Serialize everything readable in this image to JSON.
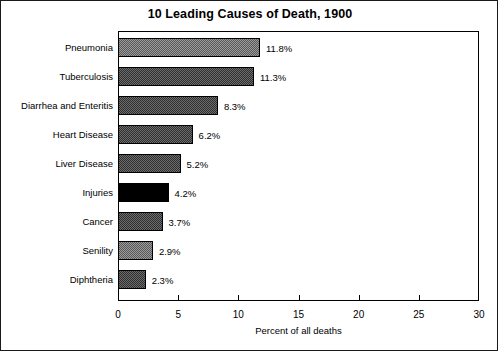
{
  "chart_data": {
    "type": "bar",
    "orientation": "horizontal",
    "title": "10 Leading Causes of Death, 1900",
    "xlabel": "Percent of all deaths",
    "ylabel": "",
    "xlim": [
      0,
      30
    ],
    "xticks": [
      0,
      5,
      10,
      15,
      20,
      25,
      30
    ],
    "grid": false,
    "legend": "none",
    "categories": [
      "Pneumonia",
      "Tuberculosis",
      "Diarrhea and Enteritis",
      "Heart Disease",
      "Liver Disease",
      "Injuries",
      "Cancer",
      "Senility",
      "Diphtheria"
    ],
    "values": [
      11.8,
      11.3,
      8.3,
      6.2,
      5.2,
      4.2,
      3.7,
      2.9,
      2.3
    ],
    "value_labels": [
      "11.8%",
      "11.3%",
      "8.3%",
      "6.2%",
      "5.2%",
      "4.2%",
      "3.7%",
      "2.9%",
      "2.3%"
    ],
    "bar_fills": [
      "gray-light",
      "gray-dark",
      "gray-dark",
      "gray-dark",
      "gray-dark",
      "black",
      "gray-dark",
      "gray-light",
      "gray-dark"
    ]
  },
  "colors": {
    "border": "#1a1a1a",
    "axis": "#000000",
    "background": "#ffffff",
    "fill_light": "#9a9a9a",
    "fill_dark": "#2e2e2e",
    "fill_black": "#000000"
  }
}
